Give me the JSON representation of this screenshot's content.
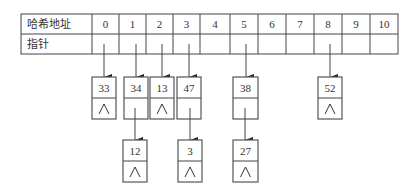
{
  "table": {
    "row_labels": {
      "address": "哈希地址",
      "pointer": "指针"
    },
    "addresses": [
      "0",
      "1",
      "2",
      "3",
      "4",
      "5",
      "6",
      "7",
      "8",
      "9",
      "10"
    ]
  },
  "chains": [
    {
      "slot": 0,
      "nodes": [
        "33"
      ]
    },
    {
      "slot": 1,
      "nodes": [
        "34",
        "12"
      ]
    },
    {
      "slot": 2,
      "nodes": [
        "13"
      ]
    },
    {
      "slot": 3,
      "nodes": [
        "47",
        "3"
      ]
    },
    {
      "slot": 5,
      "nodes": [
        "38",
        "27"
      ]
    },
    {
      "slot": 8,
      "nodes": [
        "52"
      ]
    }
  ],
  "null_symbol": "∧",
  "nodes": {
    "n33": "33",
    "n34": "34",
    "n13": "13",
    "n47": "47",
    "n38": "38",
    "n52": "52",
    "n12": "12",
    "n3": "3",
    "n27": "27"
  }
}
